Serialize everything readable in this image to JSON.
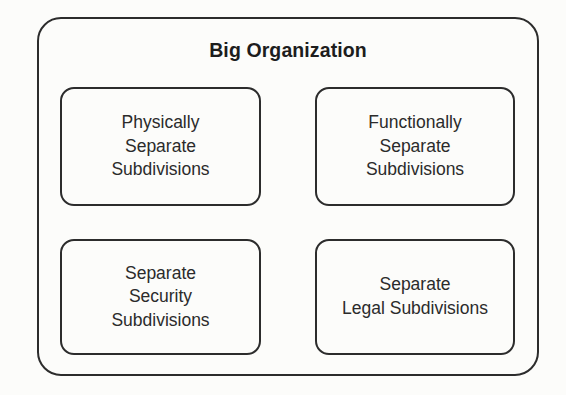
{
  "diagram": {
    "type": "nested-containment",
    "title": "Big Organization",
    "colors": {
      "background": "#fcfcfa",
      "border": "#2c2c2c",
      "title_text": "#1d1d1d",
      "box_text": "#2b2b2b"
    },
    "boxes": [
      {
        "id": "physically-separate-subdivisions",
        "label": "Physically\nSeparate\nSubdivisions",
        "position": "top-left"
      },
      {
        "id": "functionally-separate-subdivisions",
        "label": "Functionally\nSeparate\nSubdivisions",
        "position": "top-right"
      },
      {
        "id": "separate-security-subdivisions",
        "label": "Separate\nSecurity\nSubdivisions",
        "position": "bottom-left"
      },
      {
        "id": "separate-legal-subdivisions",
        "label": "Separate\nLegal Subdivisions",
        "position": "bottom-right"
      }
    ]
  }
}
